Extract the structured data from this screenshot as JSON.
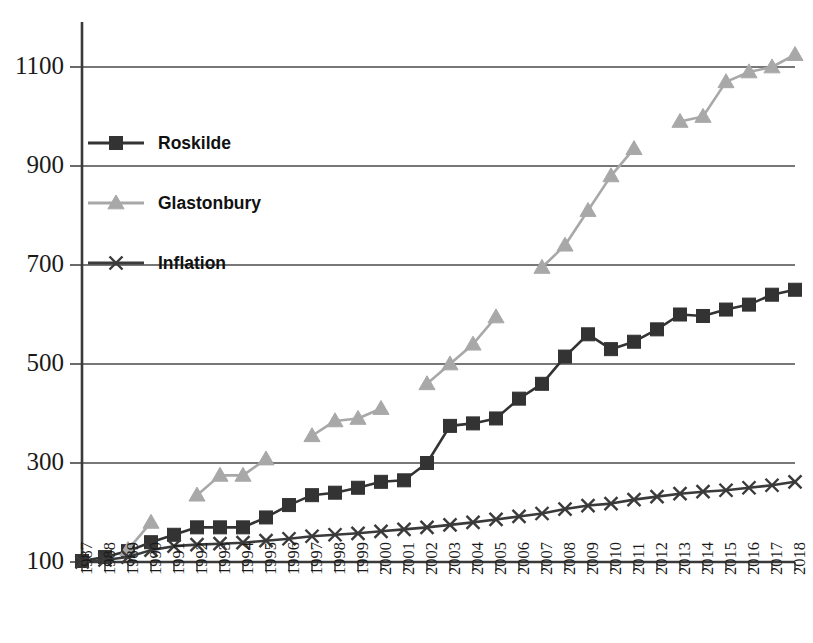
{
  "chart_data": {
    "type": "line",
    "title": "",
    "subtitle": "",
    "xlabel": "",
    "ylabel": "",
    "xlim": [
      1987,
      2018
    ],
    "ylim": [
      100,
      1160
    ],
    "yticks": [
      100,
      300,
      500,
      700,
      900,
      1100
    ],
    "ytick_labels": [
      "100",
      "300",
      "500",
      "700",
      "900",
      "1100"
    ],
    "grid": "horizontal",
    "legend_position": "inside-upper-left",
    "categories": [
      1987,
      1988,
      1989,
      1990,
      1991,
      1992,
      1993,
      1994,
      1995,
      1996,
      1997,
      1998,
      1999,
      2000,
      2001,
      2002,
      2003,
      2004,
      2005,
      2006,
      2007,
      2008,
      2009,
      2010,
      2011,
      2012,
      2013,
      2014,
      2015,
      2016,
      2017,
      2018
    ],
    "xtick_labels": [
      "1987",
      "1988",
      "1989",
      "1990",
      "1991",
      "1992",
      "1993",
      "1994",
      "1995",
      "1996",
      "1997",
      "1998",
      "1999",
      "2000",
      "2001",
      "2002",
      "2003",
      "2004",
      "2005",
      "2006",
      "2007",
      "2008",
      "2009",
      "2010",
      "2011",
      "2012",
      "2013",
      "2014",
      "2015",
      "2016",
      "2017",
      "2018"
    ],
    "series": [
      {
        "name": "Roskilde",
        "color": "#333333",
        "marker": "square",
        "values": [
          102,
          110,
          122,
          140,
          155,
          170,
          170,
          170,
          190,
          215,
          235,
          240,
          250,
          262,
          265,
          300,
          375,
          380,
          390,
          430,
          460,
          515,
          560,
          530,
          545,
          570,
          600,
          597,
          610,
          620,
          640,
          650
        ]
      },
      {
        "name": "Glastonbury",
        "color": "#a8a8a8",
        "marker": "triangle",
        "values": [
          null,
          null,
          125,
          180,
          null,
          235,
          275,
          275,
          308,
          null,
          355,
          385,
          390,
          410,
          null,
          460,
          500,
          540,
          595,
          null,
          695,
          740,
          810,
          880,
          935,
          null,
          990,
          1000,
          1070,
          1090,
          1100,
          1125
        ]
      },
      {
        "name": "Inflation",
        "color": "#3a3a3a",
        "marker": "x",
        "values": [
          100,
          104,
          110,
          124,
          132,
          135,
          137,
          139,
          143,
          147,
          152,
          155,
          158,
          162,
          166,
          170,
          175,
          180,
          186,
          192,
          198,
          207,
          214,
          218,
          226,
          232,
          238,
          242,
          245,
          250,
          255,
          262
        ]
      }
    ]
  },
  "legend": {
    "items": [
      {
        "label": "Roskilde",
        "marker": "square",
        "color": "#333333"
      },
      {
        "label": "Glastonbury",
        "marker": "triangle",
        "color": "#a8a8a8"
      },
      {
        "label": "Inflation",
        "marker": "x",
        "color": "#3a3a3a"
      }
    ]
  },
  "colors": {
    "roskilde": "#333333",
    "glastonbury": "#a8a8a8",
    "inflation": "#3a3a3a",
    "grid": "#4a4a4a",
    "axis": "#3a3a3a",
    "background": "#ffffff"
  }
}
